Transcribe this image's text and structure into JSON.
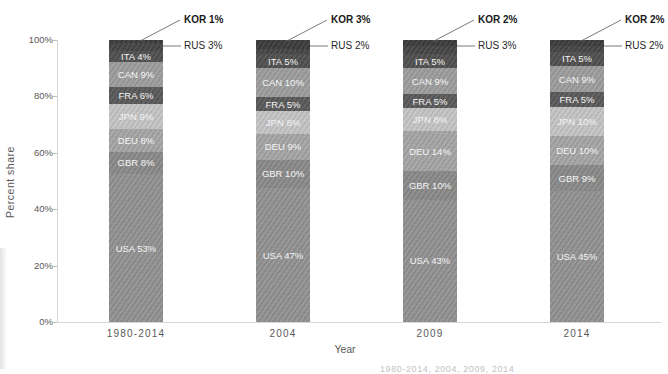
{
  "figure": {
    "ylabel": "Percent share",
    "xlabel": "Year",
    "yticks": [
      "100%",
      "80%",
      "60%",
      "40%",
      "20%",
      "0%"
    ],
    "caption_fragment": "1980-2014, 2004, 2009, 2014"
  },
  "chart_data": {
    "type": "bar",
    "stacked": true,
    "normalized_to_100": true,
    "title": "",
    "xlabel": "Year",
    "ylabel": "Percent share",
    "ylim": [
      0,
      100
    ],
    "grid": false,
    "legend": "none",
    "categories": [
      "1980-2014",
      "2004",
      "2009",
      "2014"
    ],
    "series": [
      {
        "name": "USA",
        "values": [
          53,
          47,
          43,
          45
        ],
        "color": "#929292",
        "label_in_bar": true
      },
      {
        "name": "GBR",
        "values": [
          8,
          10,
          10,
          9
        ],
        "color": "#8a8a8a",
        "label_in_bar": true
      },
      {
        "name": "DEU",
        "values": [
          8,
          9,
          14,
          10
        ],
        "color": "#a5a5a5",
        "label_in_bar": true
      },
      {
        "name": "JPN",
        "values": [
          9,
          8,
          8,
          10
        ],
        "color": "#c4c4c4",
        "label_in_bar": true
      },
      {
        "name": "FRA",
        "values": [
          6,
          5,
          5,
          5
        ],
        "color": "#5a5a5a",
        "label_in_bar": true
      },
      {
        "name": "CAN",
        "values": [
          9,
          10,
          9,
          9
        ],
        "color": "#9d9d9d",
        "label_in_bar": true
      },
      {
        "name": "ITA",
        "values": [
          4,
          5,
          5,
          5
        ],
        "color": "#505050",
        "label_in_bar": true
      },
      {
        "name": "RUS",
        "values": [
          3,
          2,
          3,
          2
        ],
        "color": "#464646",
        "label_in_bar": false,
        "callout": true
      },
      {
        "name": "KOR",
        "values": [
          1,
          3,
          2,
          2
        ],
        "color": "#3c3c3c",
        "label_in_bar": false,
        "callout": true,
        "callout_bold": true
      }
    ]
  }
}
